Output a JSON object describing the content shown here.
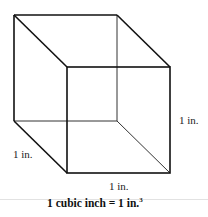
{
  "diagram": {
    "labels": {
      "height": "1 in.",
      "depth": "1 in.",
      "width": "1 in."
    },
    "caption": {
      "text": "1 cubic inch = 1 in.",
      "superscript": "3"
    },
    "colors": {
      "edges": "#111111",
      "hidden_edges": "#333333",
      "rule": "#e2e2e2"
    }
  }
}
